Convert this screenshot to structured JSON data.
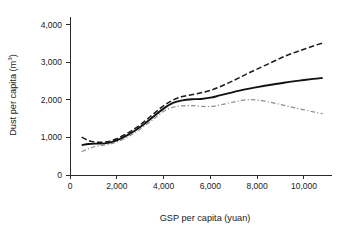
{
  "chart_data": {
    "type": "line",
    "title": "",
    "xlabel": "GSP per capita (yuan)",
    "ylabel": "Dust per capita (m³)",
    "ylabel_base": "Dust per capita (m",
    "ylabel_sup": "3",
    "ylabel_close": ")",
    "xlim": [
      0,
      11200
    ],
    "ylim": [
      0,
      4200
    ],
    "grid": false,
    "legend": "none",
    "xticks": [
      0,
      2000,
      4000,
      6000,
      8000,
      10000
    ],
    "xticklabels": [
      "0",
      "2,000",
      "4,000",
      "6,000",
      "8,000",
      "10,000"
    ],
    "yticks": [
      0,
      1000,
      2000,
      3000,
      4000
    ],
    "yticklabels": [
      "0",
      "1,000",
      "2,000",
      "3,000",
      "4,000"
    ],
    "x": [
      500,
      800,
      1100,
      1400,
      1700,
      2000,
      2400,
      2800,
      3200,
      3600,
      4000,
      4400,
      4800,
      5200,
      5600,
      6000,
      6400,
      6800,
      7200,
      7600,
      8000,
      8600,
      9200,
      9800,
      10400,
      10800
    ],
    "series": [
      {
        "name": "Upper confidence bound",
        "style": "dashed",
        "color": "#1a1a1a",
        "values": [
          1005,
          915,
          875,
          870,
          900,
          965,
          1090,
          1245,
          1430,
          1640,
          1840,
          1990,
          2085,
          2135,
          2185,
          2250,
          2345,
          2455,
          2575,
          2700,
          2815,
          2990,
          3160,
          3300,
          3430,
          3510
        ]
      },
      {
        "name": "Estimated relationship",
        "style": "solid",
        "color": "#111111",
        "values": [
          795,
          825,
          835,
          835,
          860,
          920,
          1040,
          1190,
          1370,
          1570,
          1765,
          1915,
          1985,
          2015,
          2020,
          2055,
          2115,
          2175,
          2235,
          2290,
          2335,
          2400,
          2460,
          2510,
          2555,
          2580
        ]
      },
      {
        "name": "Lower confidence bound",
        "style": "dashdot",
        "color": "#8e8e8e",
        "values": [
          620,
          700,
          760,
          790,
          820,
          875,
          990,
          1135,
          1310,
          1500,
          1690,
          1800,
          1840,
          1845,
          1825,
          1820,
          1860,
          1915,
          1965,
          2000,
          1990,
          1930,
          1845,
          1760,
          1680,
          1630
        ]
      }
    ]
  },
  "axes": {
    "x_axis_name": "x-axis",
    "y_axis_name": "y-axis"
  }
}
